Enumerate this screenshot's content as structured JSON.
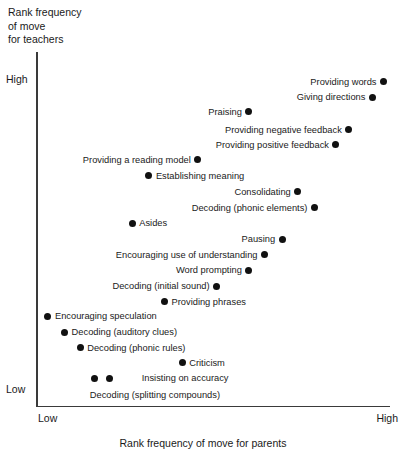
{
  "chart_data": {
    "type": "scatter",
    "title": "",
    "ylabel": "Rank frequency\nof move\nfor teachers",
    "xlabel": "Rank frequency of move for parents",
    "x_ticks": [
      "Low",
      "High"
    ],
    "y_ticks": [
      "High",
      "Low"
    ],
    "xlim": [
      0,
      100
    ],
    "ylim": [
      0,
      100
    ],
    "grid": false,
    "legend": "none",
    "points": [
      {
        "label": "Providing words",
        "x": 98.7,
        "y": 95.2,
        "label_side": "left"
      },
      {
        "label": "Giving directions",
        "x": 95.5,
        "y": 90.4,
        "label_side": "left"
      },
      {
        "label": "Praising",
        "x": 59.9,
        "y": 85.9,
        "label_side": "left"
      },
      {
        "label": "Providing negative feedback",
        "x": 88.7,
        "y": 80.5,
        "label_side": "left"
      },
      {
        "label": "Providing positive feedback",
        "x": 85.0,
        "y": 75.8,
        "label_side": "left"
      },
      {
        "label": "Providing a reading model",
        "x": 45.2,
        "y": 71.3,
        "label_side": "left"
      },
      {
        "label": "Establishing meaning",
        "x": 31.1,
        "y": 66.4,
        "label_side": "right"
      },
      {
        "label": "Consolidating",
        "x": 74.0,
        "y": 61.4,
        "label_side": "left"
      },
      {
        "label": "Decoding (phonic elements)",
        "x": 78.8,
        "y": 56.5,
        "label_side": "left"
      },
      {
        "label": "Asides",
        "x": 26.3,
        "y": 51.8,
        "label_side": "right"
      },
      {
        "label": "Pausing",
        "x": 69.5,
        "y": 46.9,
        "label_side": "left"
      },
      {
        "label": "Encouraging use of understanding",
        "x": 64.4,
        "y": 42.1,
        "label_side": "left"
      },
      {
        "label": "Word prompting",
        "x": 59.9,
        "y": 37.3,
        "label_side": "left"
      },
      {
        "label": "Decoding (initial sound)",
        "x": 50.6,
        "y": 32.5,
        "label_side": "left"
      },
      {
        "label": "Providing phrases",
        "x": 35.6,
        "y": 27.7,
        "label_side": "right"
      },
      {
        "label": "Encouraging speculation",
        "x": 2.0,
        "y": 23.2,
        "label_side": "right"
      },
      {
        "label": "Decoding (auditory clues)",
        "x": 6.8,
        "y": 18.4,
        "label_side": "right"
      },
      {
        "label": "Decoding (phonic rules)",
        "x": 11.3,
        "y": 13.6,
        "label_side": "right"
      },
      {
        "label": "Criticism",
        "x": 40.7,
        "y": 9.0,
        "label_side": "right"
      },
      {
        "label": "Insisting on accuracy",
        "x": 19.8,
        "y": 4.2,
        "label_side": "right",
        "label_offset_x": 25
      },
      {
        "label": "Decoding (splitting compounds)",
        "x": 15.5,
        "y": 4.2,
        "label_side": "below"
      }
    ]
  },
  "axes": {
    "y_title": "Rank frequency\nof move\nfor teachers",
    "x_title": "Rank frequency of move for parents",
    "y_high": "High",
    "y_low": "Low",
    "x_low": "Low",
    "x_high": "High"
  },
  "colors": {
    "marker": "#111111",
    "axis": "#3a3a3a",
    "text": "#1a1a1a",
    "background": "#ffffff"
  }
}
